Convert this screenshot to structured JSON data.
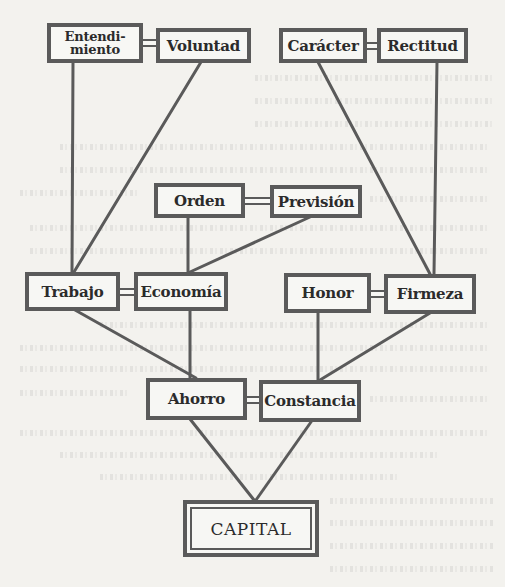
{
  "diagram": {
    "nodes": {
      "entendimiento": {
        "label": "Entendi-\nmiento",
        "line1": "Entendi-",
        "line2": "miento"
      },
      "voluntad": {
        "label": "Voluntad"
      },
      "caracter": {
        "label": "Carácter"
      },
      "rectitud": {
        "label": "Rectitud"
      },
      "orden": {
        "label": "Orden"
      },
      "prevision": {
        "label": "Previsión"
      },
      "trabajo": {
        "label": "Trabajo"
      },
      "economia": {
        "label": "Economía"
      },
      "honor": {
        "label": "Honor"
      },
      "firmeza": {
        "label": "Firmeza"
      },
      "ahorro": {
        "label": "Ahorro"
      },
      "constancia": {
        "label": "Constancia"
      },
      "capital": {
        "label": "CAPITAL"
      }
    },
    "pairs": [
      [
        "Entendimiento",
        "Voluntad"
      ],
      [
        "Carácter",
        "Rectitud"
      ],
      [
        "Orden",
        "Previsión"
      ],
      [
        "Trabajo",
        "Economía"
      ],
      [
        "Honor",
        "Firmeza"
      ],
      [
        "Ahorro",
        "Constancia"
      ]
    ],
    "edges": [
      [
        "Entendimiento",
        "Trabajo"
      ],
      [
        "Voluntad",
        "Trabajo"
      ],
      [
        "Carácter",
        "Firmeza"
      ],
      [
        "Rectitud",
        "Firmeza"
      ],
      [
        "Orden",
        "Economía"
      ],
      [
        "Previsión",
        "Economía"
      ],
      [
        "Trabajo",
        "Ahorro"
      ],
      [
        "Economía",
        "Ahorro"
      ],
      [
        "Honor",
        "Constancia"
      ],
      [
        "Firmeza",
        "Constancia"
      ],
      [
        "Ahorro",
        "CAPITAL"
      ],
      [
        "Constancia",
        "CAPITAL"
      ]
    ],
    "colors": {
      "ink": "#5a5a5a",
      "text": "#2b2b2b",
      "paper": "#f3f2ee",
      "box_fill": "#f7f7f4"
    }
  }
}
